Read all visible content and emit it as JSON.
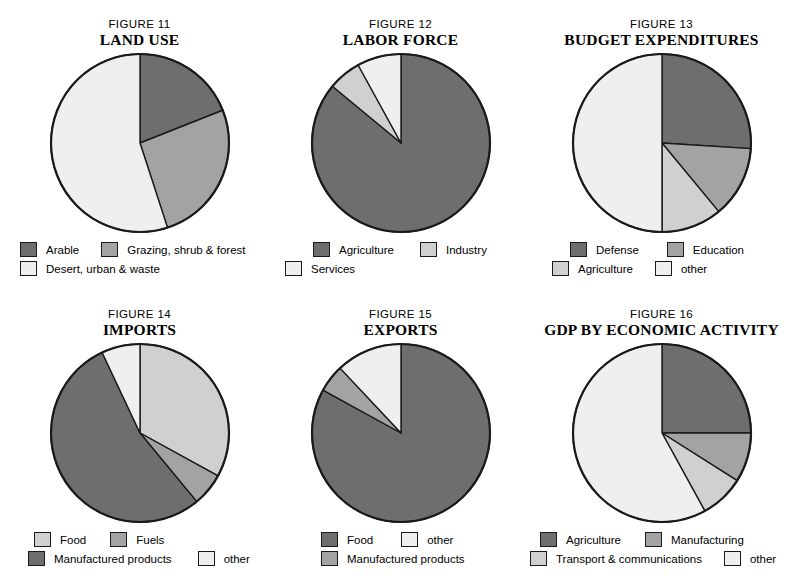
{
  "page": {
    "background": "#ffffff",
    "stroke": "#1a1a1a"
  },
  "palette": {
    "dark": "#6e6e6e",
    "mid": "#a3a3a3",
    "light": "#d0d0d0",
    "lightest": "#efefef"
  },
  "figures": [
    {
      "id": "figure-11",
      "number": "FIGURE 11",
      "title": "LAND USE",
      "legend_rows": [
        [
          {
            "label": "Arable",
            "color": "#6e6e6e"
          },
          {
            "label": "Grazing, shrub & forest",
            "color": "#a3a3a3"
          }
        ],
        [
          {
            "label": "Desert, urban & waste",
            "color": "#efefef"
          }
        ]
      ]
    },
    {
      "id": "figure-12",
      "number": "FIGURE 12",
      "title": "LABOR FORCE",
      "legend_rows": [
        [
          {
            "label": "Agriculture",
            "color": "#6e6e6e"
          },
          {
            "label": "Industry",
            "color": "#d0d0d0"
          }
        ],
        [
          {
            "label": "Services",
            "color": "#efefef"
          }
        ]
      ]
    },
    {
      "id": "figure-13",
      "number": "FIGURE 13",
      "title": "BUDGET EXPENDITURES",
      "legend_rows": [
        [
          {
            "label": "Defense",
            "color": "#6e6e6e"
          },
          {
            "label": "Education",
            "color": "#a3a3a3"
          }
        ],
        [
          {
            "label": "Agriculture",
            "color": "#d0d0d0"
          },
          {
            "label": "other",
            "color": "#efefef"
          }
        ]
      ]
    },
    {
      "id": "figure-14",
      "number": "FIGURE 14",
      "title": "IMPORTS",
      "legend_rows": [
        [
          {
            "label": "Food",
            "color": "#d0d0d0"
          },
          {
            "label": "Fuels",
            "color": "#a3a3a3"
          }
        ],
        [
          {
            "label": "Manufactured products",
            "color": "#6e6e6e"
          },
          {
            "label": "other",
            "color": "#efefef"
          }
        ]
      ]
    },
    {
      "id": "figure-15",
      "number": "FIGURE 15",
      "title": "EXPORTS",
      "legend_rows": [
        [
          {
            "label": "Food",
            "color": "#6e6e6e"
          },
          {
            "label": "other",
            "color": "#efefef"
          }
        ],
        [
          {
            "label": "Manufactured products",
            "color": "#a3a3a3"
          }
        ]
      ]
    },
    {
      "id": "figure-16",
      "number": "FIGURE 16",
      "title": "GDP BY ECONOMIC ACTIVITY",
      "legend_rows": [
        [
          {
            "label": "Agriculture",
            "color": "#6e6e6e"
          },
          {
            "label": "Manufacturing",
            "color": "#a3a3a3"
          }
        ],
        [
          {
            "label": "Transport & communications",
            "color": "#d0d0d0"
          },
          {
            "label": "other",
            "color": "#efefef"
          }
        ]
      ]
    }
  ],
  "chart_data": [
    {
      "type": "pie",
      "id": "figure-11",
      "title": "LAND USE",
      "subtitle": "FIGURE 11",
      "start_angle_deg": 0,
      "direction": "clockwise",
      "legend_position": "bottom",
      "labels": [
        "Arable",
        "Grazing, shrub & forest",
        "Desert, urban & waste"
      ],
      "values": [
        19,
        26,
        55
      ],
      "colors": [
        "#6e6e6e",
        "#a3a3a3",
        "#efefef"
      ],
      "unit": "percent"
    },
    {
      "type": "pie",
      "id": "figure-12",
      "title": "LABOR FORCE",
      "subtitle": "FIGURE 12",
      "start_angle_deg": 0,
      "direction": "clockwise",
      "legend_position": "bottom",
      "labels": [
        "Agriculture",
        "Industry",
        "Services"
      ],
      "values": [
        86,
        6,
        8
      ],
      "colors": [
        "#6e6e6e",
        "#d0d0d0",
        "#efefef"
      ],
      "unit": "percent"
    },
    {
      "type": "pie",
      "id": "figure-13",
      "title": "BUDGET EXPENDITURES",
      "subtitle": "FIGURE 13",
      "start_angle_deg": 0,
      "direction": "clockwise",
      "legend_position": "bottom",
      "labels": [
        "Defense",
        "Education",
        "Agriculture",
        "other"
      ],
      "values": [
        26,
        13,
        11,
        50
      ],
      "colors": [
        "#6e6e6e",
        "#a3a3a3",
        "#d0d0d0",
        "#efefef"
      ],
      "unit": "percent"
    },
    {
      "type": "pie",
      "id": "figure-14",
      "title": "IMPORTS",
      "subtitle": "FIGURE 14",
      "start_angle_deg": 0,
      "direction": "clockwise",
      "legend_position": "bottom",
      "labels": [
        "Food",
        "Fuels",
        "Manufactured products",
        "other"
      ],
      "values": [
        33,
        6,
        54,
        7
      ],
      "colors": [
        "#d0d0d0",
        "#a3a3a3",
        "#6e6e6e",
        "#efefef"
      ],
      "unit": "percent"
    },
    {
      "type": "pie",
      "id": "figure-15",
      "title": "EXPORTS",
      "subtitle": "FIGURE 15",
      "start_angle_deg": 0,
      "direction": "clockwise",
      "legend_position": "bottom",
      "labels": [
        "Food",
        "Manufactured products",
        "other"
      ],
      "values": [
        83,
        5,
        12
      ],
      "colors": [
        "#6e6e6e",
        "#a3a3a3",
        "#efefef"
      ],
      "unit": "percent"
    },
    {
      "type": "pie",
      "id": "figure-16",
      "title": "GDP BY ECONOMIC ACTIVITY",
      "subtitle": "FIGURE 16",
      "start_angle_deg": 0,
      "direction": "clockwise",
      "legend_position": "bottom",
      "labels": [
        "Agriculture",
        "Manufacturing",
        "Transport & communications",
        "other"
      ],
      "values": [
        25,
        9,
        8,
        58
      ],
      "colors": [
        "#6e6e6e",
        "#a3a3a3",
        "#d0d0d0",
        "#efefef"
      ],
      "unit": "percent"
    }
  ]
}
